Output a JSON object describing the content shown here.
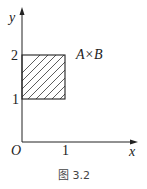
{
  "diagram": {
    "axes": {
      "x_label": "x",
      "y_label": "y",
      "origin_label": "O",
      "x_ticks": [
        "1"
      ],
      "y_ticks": [
        "1",
        "2"
      ]
    },
    "region": {
      "label": "A×B",
      "x_range": [
        0,
        1
      ],
      "y_range": [
        1,
        2
      ],
      "fill": "hatched"
    },
    "caption": "图 3.2"
  }
}
